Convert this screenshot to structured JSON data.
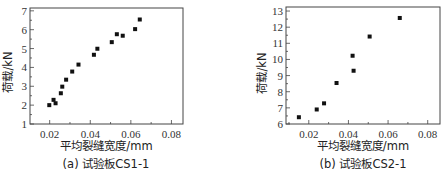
{
  "chart_data": [
    {
      "type": "scatter",
      "panel": "a",
      "caption": "(a) 试验板CS1-1",
      "xlabel": "平均裂缝宽度/mm",
      "ylabel": "荷载/kN",
      "xlim": [
        0.0103,
        0.0857
      ],
      "ylim": [
        1,
        7.15
      ],
      "xticks": [
        0.02,
        0.04,
        0.06,
        0.08
      ],
      "xtick_labels": [
        "0.02",
        "0.04",
        "0.06",
        "0.08"
      ],
      "yticks": [
        1,
        2,
        3,
        4,
        5,
        6,
        7
      ],
      "ytick_labels": [
        "1",
        "2",
        "3",
        "4",
        "5",
        "6",
        "7"
      ],
      "grid": false,
      "legend": null,
      "series": [
        {
          "name": "CS1-1",
          "x": [
            0.0198,
            0.0219,
            0.0229,
            0.0255,
            0.0262,
            0.0281,
            0.0311,
            0.0342,
            0.0418,
            0.0435,
            0.0506,
            0.0531,
            0.056,
            0.0621,
            0.0644
          ],
          "y": [
            2.0,
            2.28,
            2.1,
            2.63,
            2.98,
            3.35,
            3.78,
            4.15,
            4.67,
            4.99,
            5.34,
            5.76,
            5.68,
            6.03,
            6.54
          ]
        }
      ]
    },
    {
      "type": "scatter",
      "panel": "b",
      "caption": "(b) 试验板CS2-1",
      "xlabel": "平均裂缝宽度/mm",
      "ylabel": "荷载/kN",
      "xlim": [
        0.0085,
        0.0862
      ],
      "ylim": [
        6,
        13.25
      ],
      "xticks": [
        0.02,
        0.04,
        0.06,
        0.08
      ],
      "xtick_labels": [
        "0.02",
        "0.04",
        "0.06",
        "0.08"
      ],
      "yticks": [
        6,
        7,
        8,
        9,
        10,
        11,
        12,
        13
      ],
      "ytick_labels": [
        "6",
        "7",
        "8",
        "9",
        "10",
        "11",
        "12",
        "13"
      ],
      "grid": false,
      "legend": null,
      "series": [
        {
          "name": "CS2-1",
          "x": [
            0.015,
            0.024,
            0.0277,
            0.034,
            0.0421,
            0.0426,
            0.0507,
            0.0659
          ],
          "y": [
            6.42,
            6.9,
            7.28,
            8.54,
            10.23,
            9.3,
            11.42,
            12.57
          ]
        }
      ]
    }
  ]
}
